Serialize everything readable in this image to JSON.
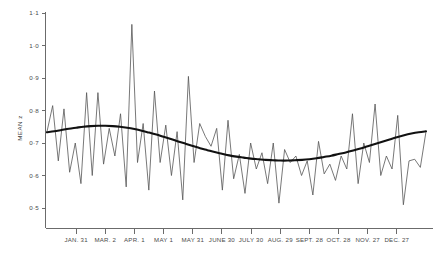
{
  "chart_data": {
    "type": "line",
    "title": "",
    "xlabel": "",
    "ylabel": "MEAN z",
    "ylim": [
      0.45,
      1.12
    ],
    "yticks": [
      1.1,
      1.0,
      0.9,
      0.8,
      0.7,
      0.6,
      0.5
    ],
    "ytick_labels": [
      "1·1",
      "1·0",
      "0·9",
      "0·8",
      "0·7",
      "0·6",
      "0·5"
    ],
    "grid": false,
    "legend": "none",
    "xtick_labels": [
      "JAN. 31",
      "MAR. 2",
      "APR. 1",
      "MAY 1",
      "MAY 31",
      "JUNE 30",
      "JULY 30",
      "AUG. 29",
      "SEPT. 28",
      "OCT. 28",
      "NOV. 27",
      "DEC. 27"
    ],
    "xtick_positions": [
      4,
      8,
      12,
      16,
      20,
      24,
      28,
      32,
      36,
      40,
      44,
      48
    ],
    "x_unit": "week",
    "x_range": [
      0,
      52
    ],
    "series": [
      {
        "name": "weekly mean z",
        "style": "thin-zigzag",
        "color": "#555555",
        "values": [
          0.735,
          0.815,
          0.645,
          0.805,
          0.61,
          0.7,
          0.575,
          0.855,
          0.6,
          0.855,
          0.635,
          0.745,
          0.66,
          0.79,
          0.565,
          1.065,
          0.64,
          0.76,
          0.555,
          0.86,
          0.64,
          0.755,
          0.6,
          0.735,
          0.525,
          0.905,
          0.64,
          0.76,
          0.72,
          0.69,
          0.745,
          0.555,
          0.77,
          0.59,
          0.665,
          0.545,
          0.7,
          0.62,
          0.67,
          0.575,
          0.7,
          0.515,
          0.68,
          0.64,
          0.66,
          0.6,
          0.645,
          0.54,
          0.705,
          0.605,
          0.635,
          0.585,
          0.66,
          0.62,
          0.79,
          0.575,
          0.7,
          0.64,
          0.82,
          0.6,
          0.66,
          0.62,
          0.785,
          0.51,
          0.645,
          0.65,
          0.625,
          0.735
        ]
      },
      {
        "name": "fitted trend",
        "style": "thick-smooth",
        "color": "#111111",
        "values": [
          0.733,
          0.736,
          0.74,
          0.744,
          0.747,
          0.75,
          0.752,
          0.753,
          0.753,
          0.752,
          0.75,
          0.747,
          0.743,
          0.738,
          0.732,
          0.726,
          0.719,
          0.712,
          0.705,
          0.698,
          0.691,
          0.684,
          0.678,
          0.672,
          0.667,
          0.662,
          0.658,
          0.655,
          0.652,
          0.65,
          0.648,
          0.647,
          0.646,
          0.646,
          0.647,
          0.648,
          0.65,
          0.653,
          0.657,
          0.661,
          0.666,
          0.671,
          0.677,
          0.683,
          0.69,
          0.697,
          0.704,
          0.711,
          0.718,
          0.724,
          0.729,
          0.733,
          0.736
        ]
      }
    ]
  },
  "axis": {
    "y_title": "MEAN z"
  }
}
